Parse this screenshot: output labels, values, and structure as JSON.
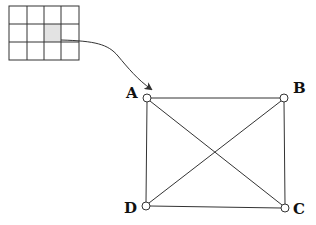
{
  "diagram": {
    "title": "",
    "colors": {
      "stroke": "#333333",
      "highlight_cell": "#e3e3e3",
      "background": "#ffffff"
    },
    "grid": {
      "rows": 3,
      "cols": 4,
      "x": 9,
      "y": 6,
      "cell_w": 17.5,
      "cell_h": 18,
      "highlighted_cell": {
        "row": 1,
        "col": 2
      }
    },
    "arrow": {
      "from": "grid.highlighted_cell",
      "to": "node-A"
    },
    "nodes": [
      {
        "id": "A",
        "label": "A",
        "x": 147,
        "y": 98,
        "label_pos": "left"
      },
      {
        "id": "B",
        "label": "B",
        "x": 284,
        "y": 98,
        "label_pos": "right"
      },
      {
        "id": "C",
        "label": "C",
        "x": 285,
        "y": 208,
        "label_pos": "right"
      },
      {
        "id": "D",
        "label": "D",
        "x": 146,
        "y": 206,
        "label_pos": "left"
      }
    ],
    "edges": [
      [
        "A",
        "B"
      ],
      [
        "B",
        "C"
      ],
      [
        "C",
        "D"
      ],
      [
        "D",
        "A"
      ],
      [
        "A",
        "C"
      ],
      [
        "B",
        "D"
      ]
    ]
  }
}
